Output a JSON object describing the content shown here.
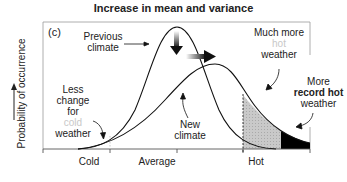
{
  "title": "Increase in mean and variance",
  "panel_label": "(c)",
  "y_axis_label": "Probability of occurrence",
  "x_axis_ticks": [
    "Cold",
    "Average",
    "Hot"
  ],
  "annotations": {
    "previous_climate": [
      "Previous",
      "climate"
    ],
    "new_climate": [
      "New",
      "climate"
    ],
    "less_change": [
      "Less",
      "change",
      "for",
      "cold",
      "weather"
    ],
    "much_more_hot": [
      "Much more",
      "hot",
      "weather"
    ],
    "more_record_hot": [
      "More",
      "record hot",
      "weather"
    ]
  },
  "colors": {
    "curve": "#111111",
    "hot_shade": "#c8c8c8",
    "record_hot_shade": "#000000",
    "frame": "#9a9a9a",
    "faint_text": "#c8c8c8"
  }
}
